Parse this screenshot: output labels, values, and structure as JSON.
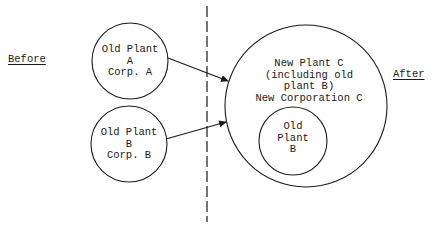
{
  "diagram": {
    "type": "before-after merger diagram",
    "labels": {
      "before": "Before",
      "after": "After"
    },
    "nodes": [
      {
        "id": "old-plant-a",
        "lines": [
          "Old Plant",
          "A",
          "Corp. A"
        ],
        "cx": 130,
        "cy": 61,
        "r": 38
      },
      {
        "id": "old-plant-b",
        "lines": [
          "Old Plant",
          "B",
          "Corp. B"
        ],
        "cx": 129,
        "cy": 144,
        "r": 38
      },
      {
        "id": "new-plant-c",
        "lines": [
          "New Plant C",
          "(including old",
          "plant B)",
          "New Corporation C"
        ],
        "cx": 306,
        "cy": 106,
        "r": 81
      },
      {
        "id": "inner-old-plant-b",
        "lines": [
          "Old",
          "Plant",
          "B"
        ],
        "cx": 293,
        "cy": 141,
        "r": 34
      }
    ],
    "edges": [
      {
        "from": "old-plant-a",
        "to": "new-plant-c",
        "x1": 168,
        "y1": 58,
        "x2": 228,
        "y2": 81
      },
      {
        "from": "old-plant-b",
        "to": "new-plant-c",
        "x1": 166,
        "y1": 139,
        "x2": 226,
        "y2": 122
      }
    ],
    "divider": {
      "style": "dashed",
      "x": 207,
      "y1": 6,
      "y2": 222
    },
    "colors": {
      "ink": "#1a1a1a",
      "background": "#ffffff"
    }
  }
}
